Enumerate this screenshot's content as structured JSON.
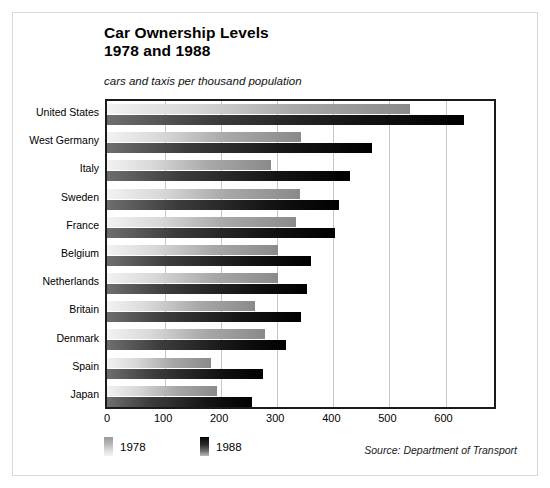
{
  "figure": {
    "title_line1": "Car Ownership Levels",
    "title_line2": "1978 and 1988",
    "subtitle": "cars and taxis per thousand population",
    "source": "Source: Department of Transport"
  },
  "legend": {
    "items": [
      {
        "label": "1978",
        "swatch": "gradient-light-swatch"
      },
      {
        "label": "1988",
        "swatch": "gradient-dark-swatch"
      }
    ]
  },
  "chart_data": {
    "type": "bar",
    "orientation": "horizontal",
    "title": "Car Ownership Levels 1978 and 1988",
    "subtitle": "cars and taxis per thousand population",
    "xlabel": "cars and taxis per thousand population",
    "ylabel": "",
    "xlim": [
      0,
      690
    ],
    "xticks": [
      0,
      100,
      200,
      300,
      400,
      500,
      600
    ],
    "xtick_labels": [
      "0",
      "100",
      "200",
      "300",
      "400",
      "500",
      "600"
    ],
    "grid": true,
    "grid_axis": "x",
    "legend_position": "below-left",
    "categories": [
      "United States",
      "West Germany",
      "Italy",
      "Sweden",
      "France",
      "Belgium",
      "Netherlands",
      "Britain",
      "Denmark",
      "Spain",
      "Japan"
    ],
    "series": [
      {
        "name": "1978",
        "color": "#c0c0c0",
        "values": [
          540,
          346,
          292,
          344,
          337,
          304,
          304,
          264,
          282,
          185,
          196
        ]
      },
      {
        "name": "1988",
        "color": "#101010",
        "values": [
          636,
          473,
          433,
          414,
          406,
          364,
          357,
          346,
          319,
          279,
          258
        ]
      }
    ],
    "annotations": [
      "Source: Department of Transport"
    ]
  }
}
